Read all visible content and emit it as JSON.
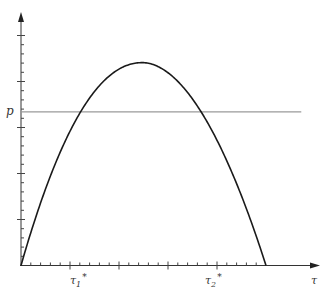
{
  "chart_data": {
    "type": "line",
    "title": "",
    "xlabel": "τ",
    "ylabel": "",
    "xlim": [
      0,
      30.5
    ],
    "ylim": [
      0,
      27.5
    ],
    "grid": false,
    "legend": null,
    "x_ticks": {
      "minor_step": 1,
      "major_step": 5,
      "range": [
        0,
        24.5
      ]
    },
    "y_ticks": {
      "minor_step": 1,
      "major_step": 5,
      "range": [
        0,
        25
      ]
    },
    "series": [
      {
        "name": "curve",
        "color": "#1a1a1a",
        "x": [
          0,
          1,
          2,
          3,
          4,
          5,
          5.6,
          6,
          7,
          8,
          9,
          10,
          11,
          12,
          12.4,
          13,
          14,
          15,
          16,
          17,
          18,
          19,
          19.5,
          20,
          21,
          22,
          23,
          24,
          25
        ],
        "y": [
          0,
          3.4,
          6.6,
          9.4,
          12.0,
          14.4,
          16.7,
          17.0,
          18.6,
          19.9,
          20.9,
          21.6,
          21.95,
          22.05,
          22.0,
          21.9,
          21.4,
          20.6,
          19.5,
          18.1,
          16.5,
          14.6,
          16.7,
          12.4,
          9.8,
          7.0,
          4.8,
          2.4,
          0
        ]
      }
    ],
    "reference_lines": [
      {
        "name": "p",
        "orientation": "horizontal",
        "y": 16.7,
        "x_range": [
          0,
          28.6
        ],
        "color": "#9a9a9a"
      }
    ],
    "annotations": [
      {
        "text": "p",
        "at": "y-axis",
        "y": 16.7
      },
      {
        "text": "τ₁*",
        "at": "x-axis",
        "x": 6.0,
        "meaning": "left intersection of curve with p"
      },
      {
        "text": "τ₂*",
        "at": "x-axis",
        "x": 19.8,
        "meaning": "right intersection of curve with p"
      },
      {
        "text": "τ",
        "at": "x-axis end"
      }
    ]
  },
  "labels": {
    "p": "p",
    "tau1": "τ",
    "tau1_sub": "1",
    "tau1_star": "*",
    "tau2": "τ",
    "tau2_sub": "2",
    "tau2_star": "*",
    "x_axis": "τ"
  }
}
